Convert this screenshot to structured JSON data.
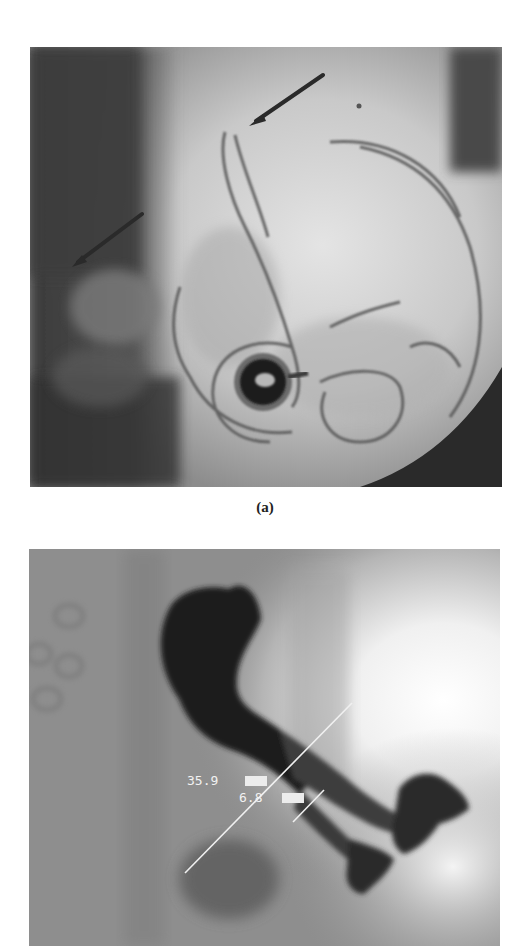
{
  "figure": {
    "panels": [
      {
        "id": "a",
        "caption": "(a)",
        "type": "abdominal-radiograph",
        "annotations": {
          "arrows": [
            {
              "name": "upper-arrow",
              "x1": 323,
              "y1": 75,
              "x2": 249,
              "y2": 125
            },
            {
              "name": "left-arrow",
              "x1": 142,
              "y1": 214,
              "x2": 72,
              "y2": 267
            }
          ]
        }
      },
      {
        "id": "b",
        "caption": "(b)",
        "type": "contrast-radiograph",
        "measurements": [
          {
            "name": "long-measurement",
            "value": "35.9",
            "unit": "mm"
          },
          {
            "name": "short-measurement",
            "value": "6.8",
            "unit": "mm"
          }
        ]
      }
    ]
  },
  "colors": {
    "background": "#ffffff",
    "arrow": "#2a2a2a",
    "measure_line": "#f0f0f0"
  }
}
